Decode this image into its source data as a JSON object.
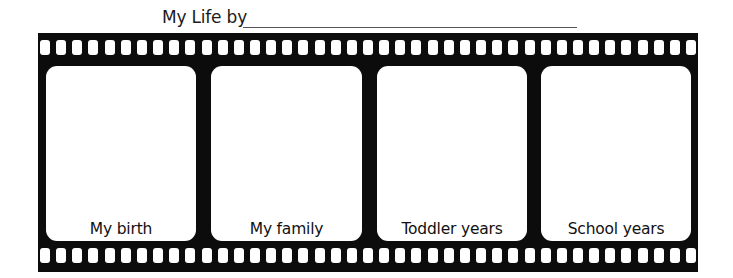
{
  "worksheet": {
    "title_prefix": "My Life by",
    "name_blank": "",
    "film_color": "#0c0c0c",
    "frames": [
      {
        "label": "My birth"
      },
      {
        "label": "My family"
      },
      {
        "label": "Toddler years"
      },
      {
        "label": "School years"
      }
    ],
    "sprocket_holes_per_row": 41
  }
}
